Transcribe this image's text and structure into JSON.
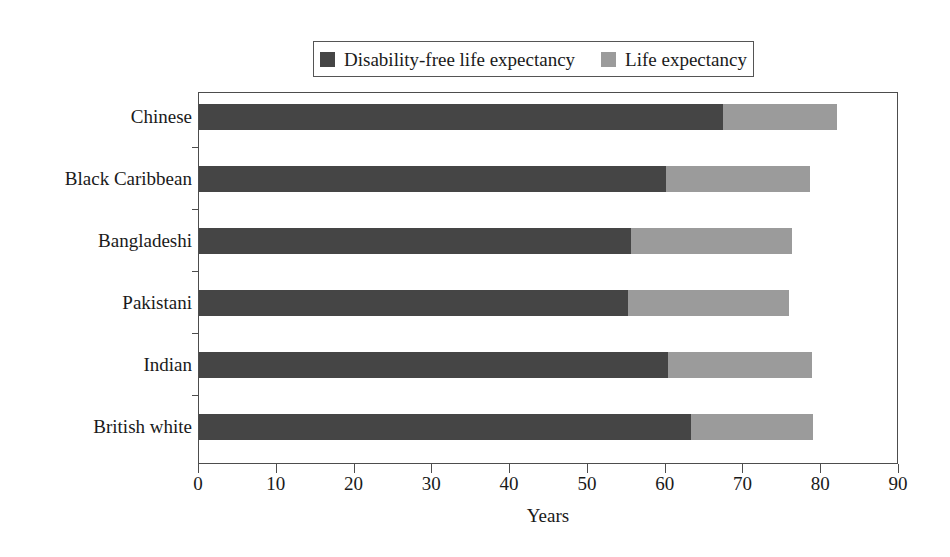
{
  "chart_data": {
    "type": "bar",
    "orientation": "horizontal",
    "stacked": true,
    "title": "",
    "xlabel": "Years",
    "ylabel": "",
    "xlim": [
      0,
      90
    ],
    "xticks": [
      0,
      10,
      20,
      30,
      40,
      50,
      60,
      70,
      80,
      90
    ],
    "grid": false,
    "legend_position": "top-center",
    "categories": [
      "British white",
      "Indian",
      "Pakistani",
      "Bangladeshi",
      "Black Caribbean",
      "Chinese"
    ],
    "series": [
      {
        "name": "Disability-free life expectancy",
        "color": "#454545",
        "values": [
          63.3,
          60.3,
          55.2,
          55.5,
          60.0,
          67.4
        ]
      },
      {
        "name": "Life expectancy",
        "color": "#9b9b9b",
        "values": [
          79.0,
          78.8,
          75.9,
          76.2,
          78.5,
          82.0
        ]
      }
    ]
  },
  "legend": {
    "entries": [
      {
        "label": "Disability-free life expectancy",
        "color": "#454545"
      },
      {
        "label": "Life expectancy",
        "color": "#9b9b9b"
      }
    ]
  },
  "axes": {
    "x_title": "Years",
    "x_tick_labels": [
      "0",
      "10",
      "20",
      "30",
      "40",
      "50",
      "60",
      "70",
      "80",
      "90"
    ],
    "y_tick_labels": [
      "Chinese",
      "Black Caribbean",
      "Bangladeshi",
      "Pakistani",
      "Indian",
      "British white"
    ]
  },
  "colors": {
    "dark_segment": "#454545",
    "light_segment": "#9b9b9b",
    "axis": "#4d4d4d",
    "text": "#1a1a1a",
    "background": "#ffffff"
  }
}
